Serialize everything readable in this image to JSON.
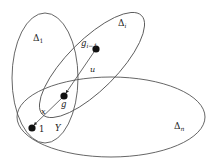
{
  "sets": [
    {
      "id": "delta-1",
      "label": "Δ",
      "sub": "1",
      "cx": 45,
      "cy": 78,
      "rx": 33,
      "ry": 65,
      "rot": 0,
      "lx": 33,
      "ly": 41
    },
    {
      "id": "delta-i",
      "label": "Δ",
      "sub": "i",
      "cx": 92,
      "cy": 65,
      "rx": 70,
      "ry": 25,
      "rot": -45,
      "lx": 118,
      "ly": 26
    },
    {
      "id": "delta-n",
      "label": "Δ",
      "sub": "n",
      "cx": 111,
      "cy": 117,
      "rx": 94,
      "ry": 40,
      "rot": 0,
      "lx": 174,
      "ly": 129
    }
  ],
  "nodes": [
    {
      "id": "g-i-minus-1",
      "label": "g",
      "sub": "i−1",
      "x": 96,
      "y": 49,
      "lx": 82,
      "ly": 45
    },
    {
      "id": "g",
      "label": "g",
      "sub": "",
      "x": 64,
      "y": 96,
      "lx": 61,
      "ly": 107
    },
    {
      "id": "one",
      "label": "1",
      "sub": "",
      "x": 32,
      "y": 128,
      "lx": 39,
      "ly": 132
    }
  ],
  "edges": [
    {
      "id": "edge-u",
      "from": "g-i-minus-1",
      "to": "g",
      "label": "u",
      "lx": 90,
      "ly": 71
    },
    {
      "id": "edge-x",
      "from": "g",
      "to": "one",
      "label": "x",
      "lx": 42,
      "ly": 114
    }
  ],
  "extra_labels": [
    {
      "id": "upsilon",
      "text": "Υ",
      "x": 56,
      "y": 131
    }
  ],
  "labels": {
    "delta_1": "Δ",
    "delta_1_sub": "1",
    "delta_i": "Δ",
    "delta_i_sub": "i",
    "delta_n": "Δ",
    "delta_n_sub": "n",
    "g_i_minus_1": "g",
    "g_i_minus_1_sub": "i−1",
    "g": "g",
    "one": "1",
    "u": "u",
    "x": "x",
    "upsilon": "Υ"
  }
}
